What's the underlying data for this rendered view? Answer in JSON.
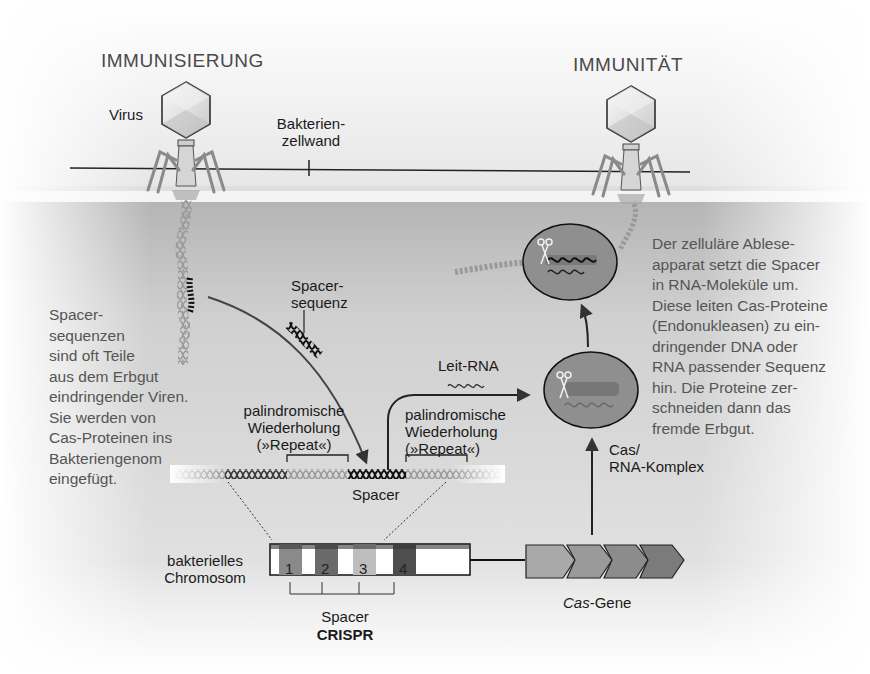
{
  "headers": {
    "left": "IMMUNISIERUNG",
    "right": "IMMUNITÄT"
  },
  "labels": {
    "virus": "Virus",
    "cell_wall_line1": "Bakterien-",
    "cell_wall_line2": "zellwand",
    "spacer_seq_line1": "Spacer-",
    "spacer_seq_line2": "sequenz",
    "repeat_left_line1": "palindromische",
    "repeat_left_line2": "Wiederholung",
    "repeat_left_line3": "(»Repeat«)",
    "repeat_right_line1": "palindromische",
    "repeat_right_line2": "Wiederholung",
    "repeat_right_line3": "(»Repeat«)",
    "guide_rna": "Leit-RNA",
    "spacer": "Spacer",
    "cas_complex_line1": "Cas/",
    "cas_complex_line2": "RNA-Komplex",
    "chromosome_line1": "bakterielles",
    "chromosome_line2": "Chromosom",
    "spacer_bottom": "Spacer",
    "crispr": "CRISPR",
    "cas_genes_italic": "Cas",
    "cas_genes_rest": "-Gene"
  },
  "crispr_spacers": [
    {
      "number": "1",
      "color": "#8a8a8a"
    },
    {
      "number": "2",
      "color": "#6a6a6a"
    },
    {
      "number": "3",
      "color": "#bdbdbd"
    },
    {
      "number": "4",
      "color": "#4e4e4e"
    }
  ],
  "cas_gene_colors": [
    "#a9a9a9",
    "#9a9a9a",
    "#8c8c8c",
    "#7b7b7b"
  ],
  "paragraphs": {
    "left": "Spacer-\nsequenzen\nsind oft Teile\naus dem Erbgut\neindringender Viren.\nSie werden von\nCas-Proteinen ins\nBakteriengenom\neingefügt.",
    "right": "Der zelluläre Ablese-\napparat setzt die Spacer\nin RNA-Moleküle um.\nDiese leiten Cas-Proteine\n(Endonukleasen) zu ein-\ndringender DNA oder\nRNA passender Sequenz\nhin. Die Proteine zer-\nschneiden dann das\nfremde Erbgut."
  },
  "colors": {
    "cell_interior": "#cfcfcf",
    "complex_fill": "#8f8f8f",
    "outline": "#1a1a1a",
    "arrow": "#333333"
  }
}
